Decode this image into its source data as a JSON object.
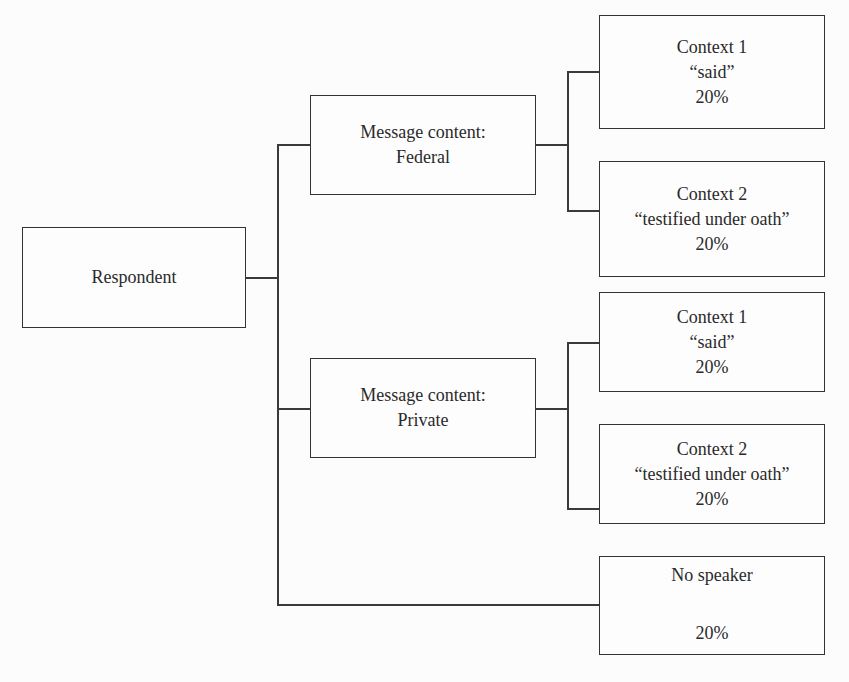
{
  "root": {
    "label": "Respondent"
  },
  "branches": [
    {
      "label_line1": "Message content:",
      "label_line2": "Federal",
      "contexts": [
        {
          "title": "Context 1",
          "verb": "“said”",
          "percent": "20%"
        },
        {
          "title": "Context 2",
          "verb": "“testified under oath”",
          "percent": "20%"
        }
      ]
    },
    {
      "label_line1": "Message content:",
      "label_line2": "Private",
      "contexts": [
        {
          "title": "Context 1",
          "verb": "“said”",
          "percent": "20%"
        },
        {
          "title": "Context 2",
          "verb": "“testified under oath”",
          "percent": "20%"
        }
      ]
    }
  ],
  "no_speaker": {
    "title": "No speaker",
    "percent": "20%"
  }
}
